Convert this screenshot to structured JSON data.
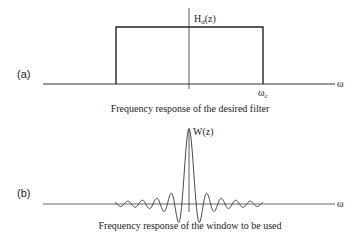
{
  "panel_a": {
    "tag": "(a)",
    "y_label_main": "H",
    "y_label_sub": "d",
    "y_label_arg": "(z)",
    "cutoff_main": "ω",
    "cutoff_sub": "c",
    "x_label": "ω",
    "caption": "Frequency response of the desired filter"
  },
  "panel_b": {
    "tag": "(b)",
    "y_label": "W(z)",
    "x_label": "ω",
    "caption": "Frequency response of the window to be used"
  },
  "colors": {
    "line": "#222222",
    "background": "#ffffff"
  }
}
